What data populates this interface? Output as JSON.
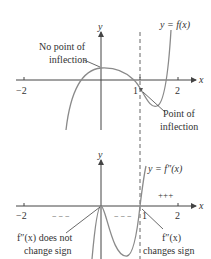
{
  "colors": {
    "axis": "#444444",
    "curve": "#8a8a8a",
    "text": "#333333",
    "dashed": "#666666"
  },
  "top_graph": {
    "y_axis_label": "y",
    "x_axis_label": "x",
    "curve_label": "y = f(x)",
    "ticks": {
      "neg2": "−2",
      "one": "1",
      "two": "2"
    },
    "annotation_left_line1": "No point of",
    "annotation_left_line2": "inflection",
    "annotation_right_line1": "Point of",
    "annotation_right_line2": "inflection"
  },
  "bottom_graph": {
    "y_axis_label": "y",
    "x_axis_label": "x",
    "curve_label": "y = f″(x)",
    "ticks": {
      "neg2": "−2",
      "one": "1",
      "two": "2"
    },
    "sign_left": "− − −",
    "sign_middle": "− − −",
    "sign_right": "+++",
    "annotation_left_line1": "f″(x) does not",
    "annotation_left_line2": "change sign",
    "annotation_right_line1": "f″(x)",
    "annotation_right_line2": "changes sign"
  }
}
